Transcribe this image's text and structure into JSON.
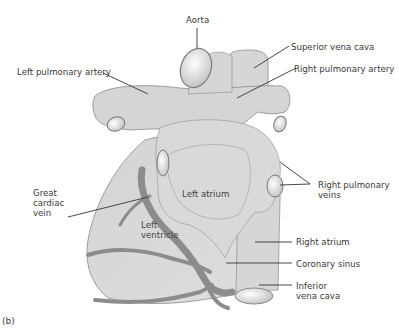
{
  "figure": {
    "panel_label": "(b)"
  },
  "labels": {
    "aorta": "Aorta",
    "superior_vena_cava": "Superior vena cava",
    "left_pulmonary_artery": "Left pulmonary artery",
    "right_pulmonary_artery": "Right pulmonary artery",
    "great_cardiac_vein": [
      "Great",
      "cardiac",
      "vein"
    ],
    "left_atrium": "Left atrium",
    "left_ventricle": [
      "Left",
      "ventricle"
    ],
    "right_pulmonary_veins": [
      "Right pulmonary",
      "veins"
    ],
    "right_atrium": "Right atrium",
    "coronary_sinus": "Coronary sinus",
    "inferior_vena_cava": [
      "Inferior",
      "vena cava"
    ]
  },
  "colors": {
    "tissue_fill": "#d9d9d9",
    "tissue_outline": "#8a8a8a",
    "vein": "#8c8c8c",
    "leader_line": "#333333",
    "text": "#3a3a3a",
    "background": "#ffffff"
  }
}
